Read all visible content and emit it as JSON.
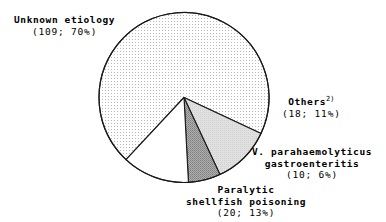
{
  "chart_data": {
    "type": "pie",
    "title": "",
    "subtitle": "",
    "xlabel": "",
    "ylabel": "",
    "legend_position": "labels-outside",
    "grid": false,
    "total_cases": 157,
    "units": "cases",
    "value_format": "(count; percent)",
    "categories": [
      "Unknown etiology",
      "Others",
      "V. parahaemolyticus gastroenteritis",
      "Paralytic shellfish poisoning"
    ],
    "values": [
      109,
      18,
      10,
      20
    ],
    "percents": [
      70,
      11,
      6,
      13
    ],
    "slices": [
      {
        "name": "Unknown etiology",
        "count": 109,
        "percent": 70,
        "fill": "stipple-light",
        "color": "#ececec",
        "start_angle_deg": 133,
        "end_angle_deg": 385
      },
      {
        "name": "Others",
        "count": 18,
        "percent": 11,
        "footnote_marker": "2)",
        "fill": "solid-light-gray",
        "color": "#dcdcdc",
        "start_angle_deg": 25,
        "end_angle_deg": 65
      },
      {
        "name": "V. parahaemolyticus gastroenteritis",
        "count": 10,
        "percent": 6,
        "fill": "hatch-dark",
        "color": "#9a9a9a",
        "start_angle_deg": 65,
        "end_angle_deg": 87
      },
      {
        "name": "Paralytic shellfish poisoning",
        "count": 20,
        "percent": 13,
        "fill": "solid-white",
        "color": "#ffffff",
        "start_angle_deg": 87,
        "end_angle_deg": 133
      }
    ]
  },
  "labels": {
    "unknown": {
      "line1": "Unknown etiology",
      "line2": "(109;  70%)"
    },
    "others": {
      "line1": "Others",
      "superscript": "2)",
      "line2": "(18;  11%)"
    },
    "vpara": {
      "line1": "V. parahaemolyticus",
      "line2": "gastroenteritis",
      "line3": "(10;  6%)"
    },
    "psp": {
      "line1": "Paralytic",
      "line2": "shellfish poisoning",
      "line3": "(20;  13%)"
    }
  },
  "colors": {
    "outline": "#1a1a1a",
    "background": "#ffffff",
    "text": "#000000",
    "slice_unknown": "#ececec",
    "slice_others": "#dcdcdc",
    "slice_vpara": "#9a9a9a",
    "slice_psp": "#ffffff"
  }
}
